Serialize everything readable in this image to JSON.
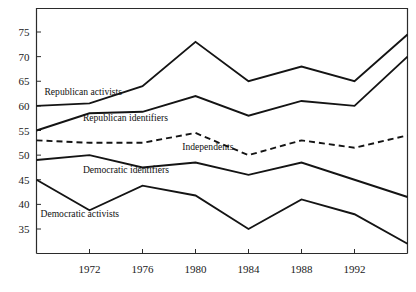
{
  "chart_data": {
    "type": "line",
    "title": "",
    "subtitle": "",
    "xlabel": "",
    "ylabel": "",
    "x": [
      1968,
      1972,
      1976,
      1980,
      1984,
      1988,
      1992,
      1996
    ],
    "xtick_labels": [
      "1972",
      "1976",
      "1980",
      "1984",
      "1988",
      "1992"
    ],
    "xtick_values": [
      1972,
      1976,
      1980,
      1984,
      1988,
      1992
    ],
    "ytick_labels": [
      "35",
      "40",
      "45",
      "50",
      "55",
      "60",
      "65",
      "70",
      "75"
    ],
    "ytick_values": [
      35,
      40,
      45,
      50,
      55,
      60,
      65,
      70,
      75
    ],
    "xlim": [
      1968,
      1996
    ],
    "ylim": [
      32,
      78
    ],
    "grid": false,
    "legend_position": "inline-annotations",
    "series": [
      {
        "name": "Republican activists",
        "style": "solid",
        "color": "#141414",
        "values": [
          60.0,
          60.5,
          64.0,
          73.0,
          65.0,
          68.0,
          65.0,
          74.5
        ],
        "label": "Republican activists",
        "label_x": 1968.6,
        "label_y": 62.2
      },
      {
        "name": "Republican identifiers",
        "style": "solid",
        "color": "#141414",
        "values": [
          55.0,
          58.5,
          58.8,
          62.0,
          58.0,
          61.0,
          60.0,
          70.0
        ],
        "label": "Republican identifiers",
        "label_x": 1971.5,
        "label_y": 57.0
      },
      {
        "name": "Independents",
        "style": "dashed",
        "color": "#141414",
        "values": [
          53.0,
          52.5,
          52.5,
          54.5,
          50.0,
          53.0,
          51.5,
          54.0
        ],
        "label": "Independents",
        "label_x": 1979.0,
        "label_y": 51.0
      },
      {
        "name": "Democratic identifiers",
        "style": "solid",
        "color": "#141414",
        "values": [
          49.0,
          50.0,
          47.5,
          48.5,
          46.0,
          48.5,
          45.0,
          41.5
        ],
        "label": "Democratic identifiers",
        "label_x": 1971.5,
        "label_y": 46.4
      },
      {
        "name": "Democratic activists",
        "style": "solid",
        "color": "#141414",
        "values": [
          45.0,
          38.8,
          43.8,
          41.8,
          35.0,
          41.0,
          38.0,
          32.0
        ],
        "label": "Democratic activists",
        "label_x": 1968.3,
        "label_y": 37.4
      }
    ]
  },
  "colors": {
    "line": "#141414",
    "axis": "#2b2b2b",
    "background": "#ffffff"
  }
}
